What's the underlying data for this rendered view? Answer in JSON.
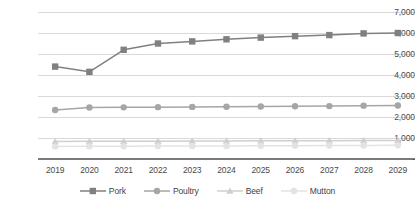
{
  "chart_data": {
    "type": "line",
    "title": "",
    "subtitle": "",
    "xlabel": "",
    "ylabel": "",
    "categories": [
      "2019",
      "2020",
      "2021",
      "2022",
      "2023",
      "2024",
      "2025",
      "2026",
      "2027",
      "2028",
      "2029"
    ],
    "ylim": [
      0,
      7000
    ],
    "ytick_values": [
      0,
      1000,
      2000,
      3000,
      4000,
      5000,
      6000,
      7000
    ],
    "ytick_labels": [
      "-",
      "1,000",
      "2,000",
      "3,000",
      "4,000",
      "5,000",
      "6,000",
      "7,000"
    ],
    "grid": true,
    "legend_position": "bottom",
    "series": [
      {
        "name": "Pork",
        "color": "#808080",
        "marker": "square",
        "values": [
          4400,
          4150,
          5200,
          5500,
          5600,
          5700,
          5780,
          5850,
          5900,
          5980,
          6000
        ]
      },
      {
        "name": "Poultry",
        "color": "#a6a6a6",
        "marker": "circle",
        "values": [
          2330,
          2450,
          2460,
          2470,
          2480,
          2490,
          2500,
          2510,
          2520,
          2540,
          2550
        ]
      },
      {
        "name": "Beef",
        "color": "#cfcfcf",
        "marker": "triangle",
        "values": [
          830,
          840,
          845,
          850,
          855,
          860,
          865,
          870,
          875,
          880,
          885
        ]
      },
      {
        "name": "Mutton",
        "color": "#e3e3e3",
        "marker": "circle",
        "values": [
          600,
          605,
          610,
          615,
          620,
          625,
          630,
          635,
          640,
          645,
          650
        ]
      }
    ]
  },
  "legend": {
    "items": [
      {
        "label": "Pork"
      },
      {
        "label": "Poultry"
      },
      {
        "label": "Beef"
      },
      {
        "label": "Mutton"
      }
    ]
  },
  "colors": {
    "gridline": "#d9d9d9",
    "axis": "#7a7a7a",
    "text": "#4a4a4a",
    "background": "#ffffff"
  }
}
